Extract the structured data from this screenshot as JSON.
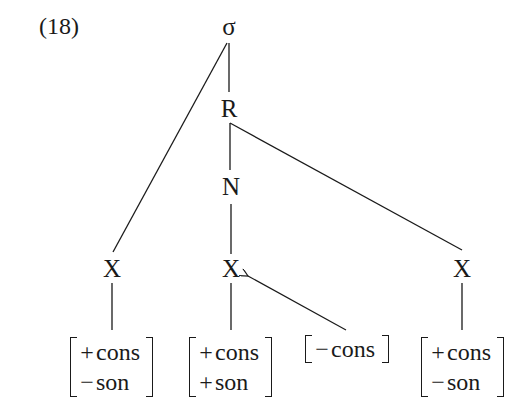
{
  "example_number": "(18)",
  "nodes": {
    "sigma": "σ",
    "rhyme": "R",
    "nucleus": "N",
    "x_left": "X",
    "x_middle": "X",
    "x_right": "X"
  },
  "feature_matrices": [
    {
      "rows": [
        {
          "sign": "+",
          "feature": "cons"
        },
        {
          "sign": "−",
          "feature": "son"
        }
      ]
    },
    {
      "rows": [
        {
          "sign": "+",
          "feature": "cons"
        },
        {
          "sign": "+",
          "feature": "son"
        }
      ]
    },
    {
      "rows": [
        {
          "sign": "−",
          "feature": "cons"
        }
      ]
    },
    {
      "rows": [
        {
          "sign": "+",
          "feature": "cons"
        },
        {
          "sign": "−",
          "feature": "son"
        }
      ]
    }
  ],
  "colors": {
    "ink": "#1a1a1a",
    "background": "#ffffff"
  }
}
